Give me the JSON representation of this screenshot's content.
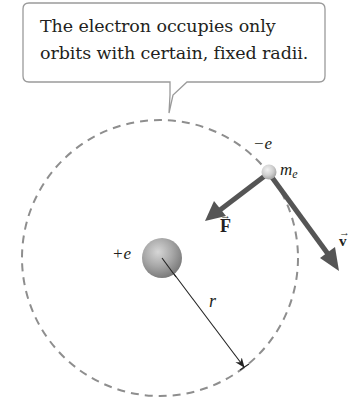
{
  "callout": {
    "lines": [
      "The electron occupies only",
      "orbits with certain, fixed radii."
    ]
  },
  "labels": {
    "electron_charge": "−e",
    "electron_mass_base": "m",
    "electron_mass_sub": "e",
    "nucleus_charge": "+e",
    "radius": "r",
    "force_vector": "F",
    "velocity_vector": "v",
    "vector_arrow": "→"
  },
  "colors": {
    "orbit": "#8e8e8e",
    "arrow_vectors": "#555555",
    "callout_border": "#9a9a9a",
    "text": "#231f20"
  },
  "geometry": {
    "orbit_center": [
      160,
      258
    ],
    "orbit_radius": 138,
    "nucleus_center": [
      162,
      258
    ],
    "nucleus_radius": 20,
    "electron_center": [
      269,
      172
    ],
    "electron_radius": 7
  }
}
